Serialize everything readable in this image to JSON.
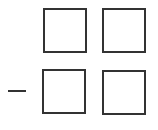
{
  "problem": {
    "operator": "minus",
    "rows": [
      {
        "digits": [
          "",
          ""
        ]
      },
      {
        "digits": [
          "",
          ""
        ]
      }
    ]
  },
  "colors": {
    "stroke": "#333333",
    "background": "#ffffff"
  }
}
